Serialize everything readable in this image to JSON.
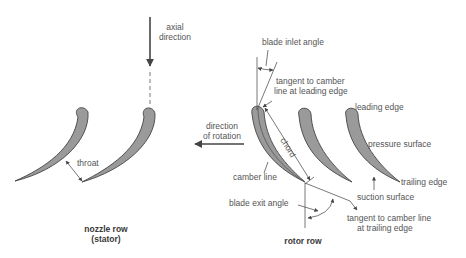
{
  "diagram": {
    "labels": {
      "axial_direction_1": "axial",
      "axial_direction_2": "direction",
      "throat": "throat",
      "nozzle_row_1": "nozzle row",
      "nozzle_row_2": "(stator)",
      "direction_of_rotation_1": "direction",
      "direction_of_rotation_2": "of rotation",
      "blade_inlet_angle": "blade inlet angle",
      "tangent_leading_1": "tangent to camber",
      "tangent_leading_2": "line at leading edge",
      "leading_edge": "leading edge",
      "chord": "chord",
      "pressure_surface": "pressure surface",
      "camber_line": "camber line",
      "trailing_edge": "trailing edge",
      "suction_surface": "suction surface",
      "blade_exit_angle": "blade exit angle",
      "tangent_trailing_1": "tangent to camber line",
      "tangent_trailing_2": "at trailing edge",
      "rotor_row": "rotor row"
    },
    "colors": {
      "blade_fill": "#9a9a9a",
      "line": "#555555",
      "text": "#555555"
    }
  }
}
